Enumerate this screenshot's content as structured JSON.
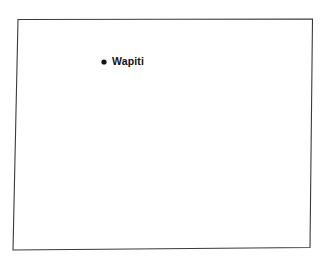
{
  "map": {
    "name": "Wyoming state outline map",
    "outline_name": "state-boundary",
    "background_color": "#ffffff",
    "outline_color": "#3a3a3a",
    "outline_points": "18,19.5 312.5,19.0 310,247.5 13,250",
    "marker_color": "#111111",
    "cities": [
      {
        "name": "Wapiti",
        "label": "Wapiti",
        "dot_cx": 104,
        "dot_cy": 62,
        "dot_r": 2.6
      }
    ]
  }
}
